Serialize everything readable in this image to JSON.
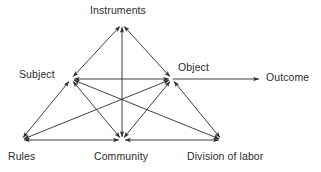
{
  "diagram": {
    "background_color": "#ffffff",
    "line_color": "#2b2b2b",
    "text_color": "#2b2b2b",
    "nodes": [
      {
        "id": "instruments",
        "label": "Instruments",
        "x": 122,
        "y": 24,
        "label_x": 90,
        "label_y": 4
      },
      {
        "id": "subject",
        "label": "Subject",
        "x": 71,
        "y": 79,
        "label_x": 19,
        "label_y": 68
      },
      {
        "id": "object",
        "label": "Object",
        "x": 172,
        "y": 79,
        "label_x": 178,
        "label_y": 61
      },
      {
        "id": "outcome",
        "label": "Outcome",
        "x": 262,
        "y": 79,
        "label_x": 266,
        "label_y": 71
      },
      {
        "id": "rules",
        "label": "Rules",
        "x": 21,
        "y": 140,
        "label_x": 8,
        "label_y": 150
      },
      {
        "id": "community",
        "label": "Community",
        "x": 122,
        "y": 140,
        "label_x": 94,
        "label_y": 150
      },
      {
        "id": "division_of_labor",
        "label": "Division of labor",
        "x": 222,
        "y": 140,
        "label_x": 187,
        "label_y": 150
      }
    ],
    "edges": [
      {
        "id": "subject-instruments",
        "from": "subject",
        "to": "instruments",
        "arrows": "both"
      },
      {
        "id": "instruments-object",
        "from": "instruments",
        "to": "object",
        "arrows": "both"
      },
      {
        "id": "subject-object",
        "from": "subject",
        "to": "object",
        "arrows": "both"
      },
      {
        "id": "object-outcome",
        "from": "object",
        "to": "outcome",
        "arrows": "end"
      },
      {
        "id": "subject-rules",
        "from": "subject",
        "to": "rules",
        "arrows": "both"
      },
      {
        "id": "object-division",
        "from": "object",
        "to": "division_of_labor",
        "arrows": "both"
      },
      {
        "id": "rules-community",
        "from": "rules",
        "to": "community",
        "arrows": "both"
      },
      {
        "id": "community-division",
        "from": "community",
        "to": "division_of_labor",
        "arrows": "both"
      },
      {
        "id": "instruments-community",
        "from": "instruments",
        "to": "community",
        "arrows": "both"
      },
      {
        "id": "subject-community",
        "from": "subject",
        "to": "community",
        "arrows": "both"
      },
      {
        "id": "object-community",
        "from": "object",
        "to": "community",
        "arrows": "both"
      },
      {
        "id": "subject-division",
        "from": "subject",
        "to": "division_of_labor",
        "arrows": "both"
      },
      {
        "id": "object-rules",
        "from": "object",
        "to": "rules",
        "arrows": "both"
      }
    ]
  }
}
